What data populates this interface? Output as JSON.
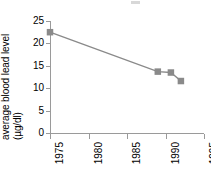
{
  "axes": {
    "ylabel_main": "average blood lead level",
    "ylabel_units": "(µg/dl)",
    "yticklabels": [
      "25",
      "20",
      "15",
      "10",
      "5",
      "0"
    ],
    "xticklabels": [
      "1975",
      "1980",
      "1985",
      "1990",
      "1995"
    ]
  },
  "colors": {
    "marker": "#8a8a8a",
    "line": "#8a8a8a",
    "axis": "#9a9a9a",
    "text": "#000000",
    "background": "#ffffff"
  },
  "chart_data": {
    "type": "line",
    "title": "",
    "xlabel": "",
    "ylabel": "average blood lead level (µg/dl)",
    "xlim": [
      1975,
      1995
    ],
    "ylim": [
      0,
      25
    ],
    "xticks": [
      1975,
      1980,
      1985,
      1990,
      1995
    ],
    "yticks": [
      0,
      5,
      10,
      15,
      20,
      25
    ],
    "grid": false,
    "legend": "none",
    "marker": "square",
    "x": [
      1975,
      1989,
      1990.7,
      1992
    ],
    "y": [
      22.5,
      13.7,
      13.5,
      11.6
    ],
    "series": [
      {
        "name": "average blood lead level",
        "points": [
          {
            "x": 1975,
            "y": 22.5
          },
          {
            "x": 1989,
            "y": 13.7
          },
          {
            "x": 1990.7,
            "y": 13.5
          },
          {
            "x": 1992,
            "y": 11.6
          }
        ]
      }
    ]
  }
}
